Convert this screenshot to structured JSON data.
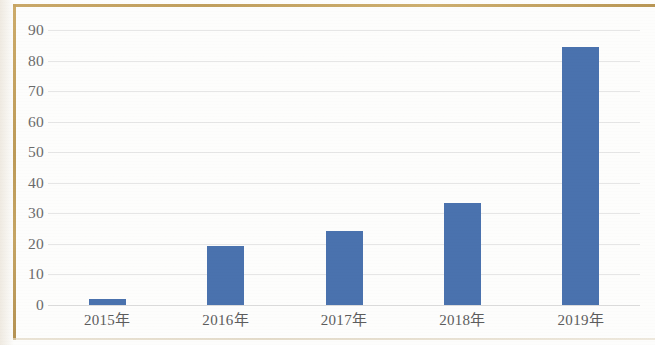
{
  "chart_data": {
    "type": "bar",
    "title": "",
    "xlabel": "",
    "ylabel": "",
    "categories": [
      "2015年",
      "2016年",
      "2017年",
      "2018年",
      "2019年"
    ],
    "values": [
      2,
      19.3,
      24.3,
      33.3,
      84.5
    ],
    "ylim": [
      0,
      90
    ],
    "ytick_step": 10,
    "yticks": [
      90,
      80,
      70,
      60,
      50,
      40,
      30,
      20,
      10,
      0
    ],
    "ytick_labels": [
      "90",
      "80",
      "70",
      "60",
      "50",
      "40",
      "30",
      "20",
      "10",
      "0"
    ],
    "grid": "horizontal",
    "legend": "none",
    "series": [
      {
        "name": "",
        "values": [
          2,
          19.3,
          24.3,
          33.3,
          84.5
        ]
      }
    ],
    "colors": {
      "bar": "#4a72ae",
      "gridline": "#e6e6e6",
      "tick_label": "#6b6b6b",
      "category_label": "#5c5c5c",
      "frame": "#bd9a55",
      "background": "#fdfdfc"
    }
  }
}
